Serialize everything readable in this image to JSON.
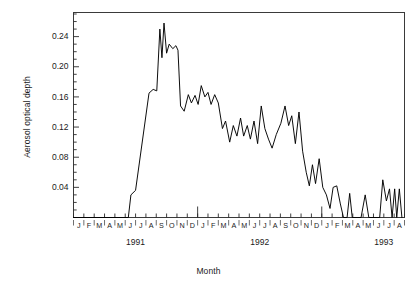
{
  "chart_data": {
    "type": "line",
    "title": "",
    "xlabel": "Month",
    "ylabel": "Aerosol optical depth",
    "ylim": [
      0.0,
      0.272
    ],
    "ytick_values": [
      0.04,
      0.08,
      0.12,
      0.16,
      0.2,
      0.24
    ],
    "ytick_labels": [
      "0.04",
      "0.08",
      "0.12",
      "0.16",
      "0.20",
      "0.24"
    ],
    "yminor_step": 0.01,
    "grid": false,
    "legend": null,
    "xtick_labels": [
      "J",
      "F",
      "M",
      "A",
      "M",
      "J",
      "J",
      "A",
      "S",
      "O",
      "N",
      "D",
      "J",
      "F",
      "M",
      "A",
      "M",
      "J",
      "J",
      "A",
      "S",
      "O",
      "N",
      "D",
      "J",
      "F",
      "M",
      "A",
      "M",
      "J",
      "J",
      "A"
    ],
    "year_labels": [
      {
        "text": "1991",
        "index": 6
      },
      {
        "text": "1992",
        "index": 18
      },
      {
        "text": "1993",
        "index": 30
      }
    ],
    "year_tick_indices": [
      12,
      24
    ],
    "x_start_label": "J 1991",
    "x_end_label": "A 1993",
    "series": [
      {
        "name": "Aerosol optical depth",
        "color": "#000000",
        "x": [
          "1991-01",
          "1991-02",
          "1991-03",
          "1991-04",
          "1991-05",
          "1991-06",
          "1991-06b",
          "1991-07",
          "1991-07b",
          "1991-08",
          "1991-08b",
          "1991-08c",
          "1991-09",
          "1991-09b",
          "1991-09c",
          "1991-10",
          "1991-10b",
          "1991-11",
          "1991-11b",
          "1991-12",
          "1991-12b",
          "1992-01",
          "1992-01b",
          "1992-02",
          "1992-02b",
          "1992-03",
          "1992-03b",
          "1992-04",
          "1992-04b",
          "1992-05",
          "1992-05b",
          "1992-06",
          "1992-06b",
          "1992-07",
          "1992-07b",
          "1992-08",
          "1992-08b",
          "1992-09",
          "1992-09b",
          "1992-10",
          "1992-10b",
          "1992-11",
          "1992-11b",
          "1992-12",
          "1992-12b",
          "1993-01",
          "1993-01b",
          "1993-02",
          "1993-02b",
          "1993-03",
          "1993-03b",
          "1993-04",
          "1993-04b",
          "1993-05",
          "1993-05b",
          "1993-06",
          "1993-06b",
          "1993-07",
          "1993-07b",
          "1993-08",
          "1993-08b"
        ],
        "values": [
          0.0,
          0.0,
          0.0,
          0.0,
          0.0,
          0.0,
          0.03,
          0.035,
          0.1,
          0.165,
          0.168,
          0.175,
          0.25,
          0.215,
          0.26,
          0.23,
          0.222,
          0.225,
          0.228,
          0.222,
          0.148,
          0.14,
          0.163,
          0.152,
          0.175,
          0.16,
          0.168,
          0.152,
          0.163,
          0.155,
          0.118,
          0.128,
          0.1,
          0.122,
          0.108,
          0.132,
          0.112,
          0.12,
          0.095,
          0.148,
          0.118,
          0.104,
          0.125,
          0.14,
          0.148,
          0.122,
          0.135,
          0.098,
          0.14,
          0.088,
          0.06,
          0.078,
          0.045,
          0.072,
          0.042,
          0.045,
          0.018,
          0.038,
          0.008,
          0.05,
          0.028
        ],
        "points": [
          {
            "t": 0.0,
            "v": 0.0
          },
          {
            "t": 5.3,
            "v": 0.0
          },
          {
            "t": 5.55,
            "v": 0.03
          },
          {
            "t": 6.0,
            "v": 0.036
          },
          {
            "t": 7.3,
            "v": 0.165
          },
          {
            "t": 7.7,
            "v": 0.17
          },
          {
            "t": 8.05,
            "v": 0.168
          },
          {
            "t": 8.35,
            "v": 0.25
          },
          {
            "t": 8.55,
            "v": 0.212
          },
          {
            "t": 8.75,
            "v": 0.258
          },
          {
            "t": 9.0,
            "v": 0.218
          },
          {
            "t": 9.25,
            "v": 0.23
          },
          {
            "t": 9.6,
            "v": 0.224
          },
          {
            "t": 9.9,
            "v": 0.228
          },
          {
            "t": 10.1,
            "v": 0.222
          },
          {
            "t": 10.35,
            "v": 0.148
          },
          {
            "t": 10.7,
            "v": 0.141
          },
          {
            "t": 11.1,
            "v": 0.163
          },
          {
            "t": 11.4,
            "v": 0.152
          },
          {
            "t": 11.75,
            "v": 0.162
          },
          {
            "t": 12.05,
            "v": 0.15
          },
          {
            "t": 12.35,
            "v": 0.175
          },
          {
            "t": 12.7,
            "v": 0.16
          },
          {
            "t": 13.0,
            "v": 0.166
          },
          {
            "t": 13.3,
            "v": 0.15
          },
          {
            "t": 13.65,
            "v": 0.163
          },
          {
            "t": 14.0,
            "v": 0.152
          },
          {
            "t": 14.4,
            "v": 0.118
          },
          {
            "t": 14.7,
            "v": 0.128
          },
          {
            "t": 15.1,
            "v": 0.1
          },
          {
            "t": 15.45,
            "v": 0.122
          },
          {
            "t": 15.8,
            "v": 0.108
          },
          {
            "t": 16.15,
            "v": 0.132
          },
          {
            "t": 16.45,
            "v": 0.108
          },
          {
            "t": 16.8,
            "v": 0.122
          },
          {
            "t": 17.1,
            "v": 0.104
          },
          {
            "t": 17.45,
            "v": 0.128
          },
          {
            "t": 17.8,
            "v": 0.098
          },
          {
            "t": 18.15,
            "v": 0.148
          },
          {
            "t": 18.5,
            "v": 0.118
          },
          {
            "t": 18.85,
            "v": 0.104
          },
          {
            "t": 19.2,
            "v": 0.092
          },
          {
            "t": 19.6,
            "v": 0.11
          },
          {
            "t": 20.05,
            "v": 0.125
          },
          {
            "t": 20.45,
            "v": 0.148
          },
          {
            "t": 20.8,
            "v": 0.122
          },
          {
            "t": 21.1,
            "v": 0.135
          },
          {
            "t": 21.45,
            "v": 0.098
          },
          {
            "t": 21.8,
            "v": 0.14
          },
          {
            "t": 22.15,
            "v": 0.088
          },
          {
            "t": 22.5,
            "v": 0.06
          },
          {
            "t": 22.8,
            "v": 0.042
          },
          {
            "t": 23.1,
            "v": 0.07
          },
          {
            "t": 23.4,
            "v": 0.045
          },
          {
            "t": 23.75,
            "v": 0.078
          },
          {
            "t": 24.1,
            "v": 0.04
          },
          {
            "t": 24.45,
            "v": 0.03
          },
          {
            "t": 24.8,
            "v": 0.012
          },
          {
            "t": 25.1,
            "v": 0.04
          },
          {
            "t": 25.45,
            "v": 0.042
          },
          {
            "t": 25.8,
            "v": 0.018
          },
          {
            "t": 26.1,
            "v": 0.0
          },
          {
            "t": 26.45,
            "v": 0.0
          },
          {
            "t": 26.7,
            "v": 0.032
          },
          {
            "t": 26.95,
            "v": 0.0
          },
          {
            "t": 27.5,
            "v": 0.0
          },
          {
            "t": 27.8,
            "v": 0.0
          },
          {
            "t": 28.2,
            "v": 0.03
          },
          {
            "t": 28.55,
            "v": 0.0
          },
          {
            "t": 29.6,
            "v": 0.0
          },
          {
            "t": 29.9,
            "v": 0.05
          },
          {
            "t": 30.25,
            "v": 0.022
          },
          {
            "t": 30.55,
            "v": 0.038
          },
          {
            "t": 30.8,
            "v": 0.0
          },
          {
            "t": 31.05,
            "v": 0.038
          },
          {
            "t": 31.25,
            "v": 0.0
          },
          {
            "t": 31.5,
            "v": 0.038
          },
          {
            "t": 31.75,
            "v": 0.0
          }
        ]
      }
    ]
  },
  "axes": {
    "y_title": "Aerosol optical depth",
    "x_title": "Month"
  }
}
